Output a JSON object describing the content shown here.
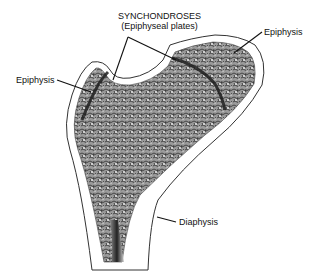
{
  "diagram": {
    "labels": {
      "synchondroses_line1": "SYNCHONDROSES",
      "synchondroses_line2": "(Epiphyseal plates)",
      "epiphysis_left": "Epiphysis",
      "epiphysis_right": "Epiphysis",
      "diaphysis": "Diaphysis"
    },
    "colors": {
      "background": "#ffffff",
      "line": "#111111",
      "spongy_bone": "#6e6e6e",
      "plate_dark": "#2a2a2a"
    }
  }
}
